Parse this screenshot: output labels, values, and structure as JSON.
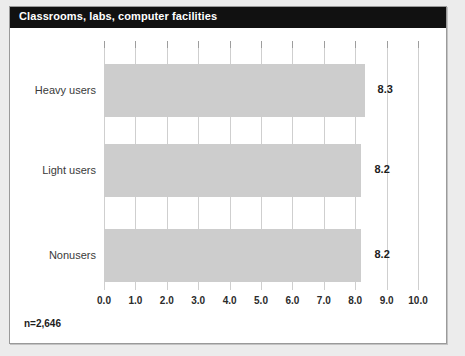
{
  "panel": {
    "title": "Classrooms, labs, computer facilities",
    "footnote": "n=2,646"
  },
  "colors": {
    "banner": "#111111",
    "banner_text": "#ffffff",
    "bar_fill": "#cdcdcd",
    "gridline": "#cfcfcf",
    "frame": "#9a9a9a",
    "page_background": "#ececec"
  },
  "chart_data": {
    "type": "bar",
    "orientation": "horizontal",
    "title": "Classrooms, labs, computer facilities",
    "categories": [
      "Heavy users",
      "Light users",
      "Nonusers"
    ],
    "values": [
      8.3,
      8.2,
      8.2
    ],
    "value_labels": [
      "8.3",
      "8.2",
      "8.2"
    ],
    "xlabel": "",
    "ylabel": "",
    "xlim": [
      0,
      10
    ],
    "xticks": [
      0,
      1,
      2,
      3,
      4,
      5,
      6,
      7,
      8,
      9,
      10
    ],
    "xtick_labels": [
      "0.0",
      "1.0",
      "2.0",
      "3.0",
      "4.0",
      "5.0",
      "6.0",
      "7.0",
      "8.0",
      "9.0",
      "10.0"
    ],
    "grid": true,
    "grid_axis": "x",
    "legend": false,
    "annotations": [
      "n=2,646"
    ]
  }
}
